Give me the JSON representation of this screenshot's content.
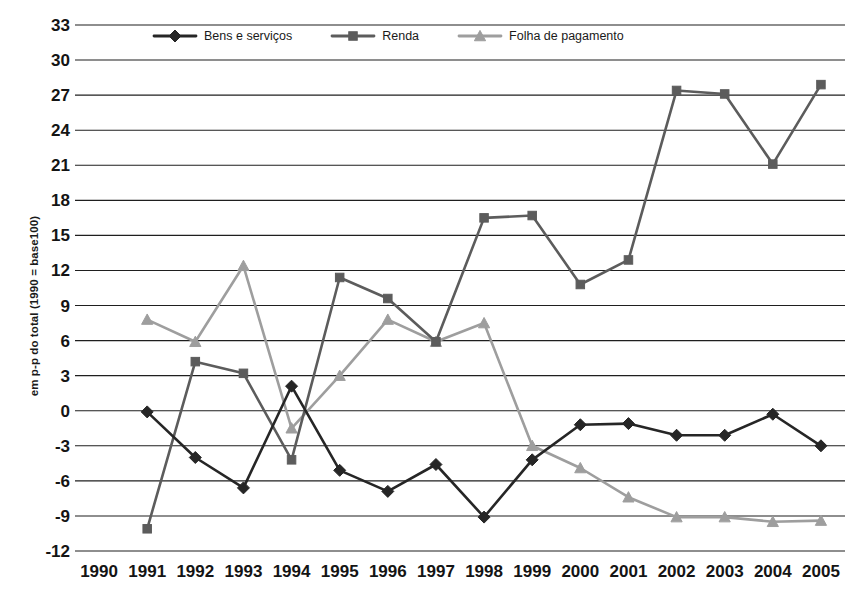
{
  "chart_data": {
    "type": "line",
    "title": "",
    "subtitle": "",
    "xlabel": "",
    "ylabel": "em p-p do total (1990 = base100)",
    "categories": [
      "1990",
      "1991",
      "1992",
      "1993",
      "1994",
      "1995",
      "1996",
      "1997",
      "1998",
      "1999",
      "2000",
      "2001",
      "2002",
      "2003",
      "2004",
      "2005"
    ],
    "x": [
      1990,
      1991,
      1992,
      1993,
      1994,
      1995,
      1996,
      1997,
      1998,
      1999,
      2000,
      2001,
      2002,
      2003,
      2004,
      2005
    ],
    "ylim": [
      -12,
      33
    ],
    "ytick_labels": [
      "33",
      "30",
      "27",
      "24",
      "21",
      "18",
      "15",
      "12",
      "9",
      "6",
      "3",
      "0",
      "-3",
      "-6",
      "-9",
      "-12"
    ],
    "yticks": [
      33,
      30,
      27,
      24,
      21,
      18,
      15,
      12,
      9,
      6,
      3,
      0,
      -3,
      -6,
      -9,
      -12
    ],
    "grid": "horizontal",
    "legend_position": "top-inside",
    "series": [
      {
        "name": "Bens e serviços",
        "marker": "diamond",
        "color": "#262626",
        "values": [
          null,
          -0.1,
          -4.0,
          -6.6,
          2.1,
          -5.1,
          -6.9,
          -4.6,
          -9.1,
          -4.2,
          -1.2,
          -1.1,
          -2.1,
          -2.1,
          -0.3,
          -3.0
        ]
      },
      {
        "name": "Renda",
        "marker": "square",
        "color": "#5c5c5c",
        "values": [
          null,
          -10.1,
          4.2,
          3.2,
          -4.2,
          11.4,
          9.6,
          5.9,
          16.5,
          16.7,
          10.8,
          12.9,
          27.4,
          27.1,
          21.1,
          27.9
        ]
      },
      {
        "name": "Folha de pagamento",
        "marker": "triangle",
        "color": "#9e9e9e",
        "values": [
          null,
          7.8,
          5.9,
          12.4,
          -1.5,
          3.0,
          7.8,
          5.9,
          7.5,
          -3.0,
          -4.9,
          -7.4,
          -9.1,
          -9.1,
          -9.5,
          -9.4
        ]
      }
    ]
  },
  "legend": {
    "items": [
      {
        "label": "Bens e serviços"
      },
      {
        "label": "Renda"
      },
      {
        "label": "Folha de pagamento"
      }
    ]
  },
  "axes": {
    "y_title": "em p-p do total (1990 = base100)"
  }
}
